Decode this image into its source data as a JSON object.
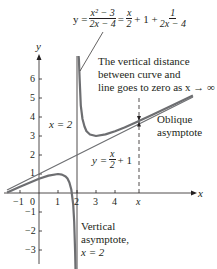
{
  "equation": {
    "lhs": "y =",
    "frac1_num": "x² − 3",
    "frac1_den": "2x − 4",
    "eq2": "=",
    "frac2_num": "x",
    "frac2_den": "2",
    "plus_one": "+ 1 +",
    "frac3_num": "1",
    "frac3_den": "2x − 4"
  },
  "annotations": {
    "distance_note": [
      "The vertical distance",
      "between curve and",
      "line goes to zero as x → ∞"
    ],
    "oblique": [
      "Oblique",
      "asymptote"
    ],
    "vertical": [
      "Vertical",
      "asymptote,",
      "x = 2"
    ],
    "x_eq_2": "x = 2",
    "line_label_lhs": "y =",
    "line_label_num": "x",
    "line_label_den": "2",
    "line_label_rhs": "+ 1"
  },
  "axes": {
    "x_label": "x",
    "y_label": "y",
    "x_ticks": [
      "−1",
      "0",
      "1",
      "2",
      "3",
      "4"
    ],
    "x_marker": "x",
    "y_ticks_pos": [
      "6",
      "5",
      "4",
      "3",
      "2",
      "1"
    ],
    "y_ticks_neg": [
      "−1",
      "−2",
      "−3"
    ]
  },
  "colors": {
    "ink": "#231f20",
    "curve": "#6d6e71",
    "line": "#6d6e71"
  }
}
